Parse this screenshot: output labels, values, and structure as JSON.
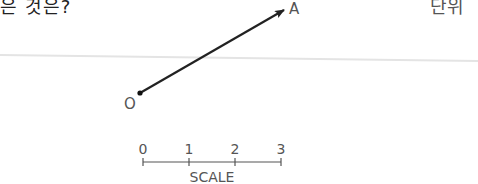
{
  "header": {
    "question_fragment": "은 것은?",
    "right_fragment": "단위"
  },
  "vector": {
    "origin_label": "O",
    "tip_label": "A",
    "origin": [
      140,
      93
    ],
    "tip": [
      285,
      9
    ],
    "color": "#222222"
  },
  "scale": {
    "ticks": [
      "0",
      "1",
      "2",
      "3"
    ],
    "label": "SCALE",
    "color": "#555555"
  }
}
